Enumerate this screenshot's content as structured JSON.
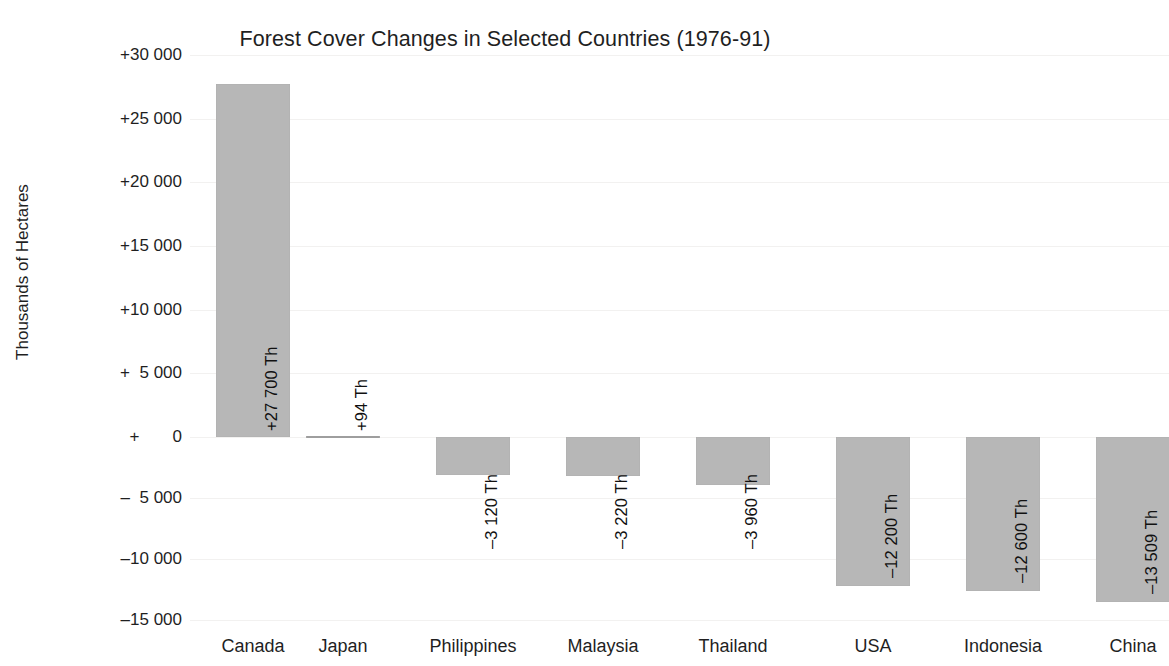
{
  "chart_data": {
    "type": "bar",
    "title": "Forest Cover Changes in Selected Countries (1976-91)",
    "xlabel": "",
    "ylabel": "Thousands of Hectares",
    "ylim": [
      -15000,
      30000
    ],
    "grid": true,
    "legend": null,
    "units": "Thousands of Hectares (Th)",
    "y_tick_labels": [
      "+30 000",
      "+25 000",
      "+20 000",
      "+15 000",
      "+10 000",
      "+  5 000",
      "+       0",
      "–  5 000",
      "–10 000",
      "–15 000"
    ],
    "y_tick_values": [
      30000,
      25000,
      20000,
      15000,
      10000,
      5000,
      0,
      -5000,
      -10000,
      -15000
    ],
    "categories": [
      "Canada",
      "Japan",
      "Philippines",
      "Malaysia",
      "Thailand",
      "USA",
      "Indonesia",
      "China"
    ],
    "values": [
      27700,
      94,
      -3120,
      -3220,
      -3960,
      -12200,
      -12600,
      -13509
    ],
    "data_labels": [
      "+27 700 Th",
      "+94 Th",
      "–3 120 Th",
      "–3 220 Th",
      "–3 960 Th",
      "–12 200 Th",
      "–12 600 Th",
      "–13 509 Th"
    ],
    "bar_color": "#b7b7b7",
    "background_color": "#ffffff",
    "text_color": "#1f1f1f"
  },
  "x_axis": {
    "labels": [
      "Canada",
      "Japan",
      "Philippines",
      "Malaysia",
      "Thailand",
      "USA",
      "Indonesia",
      "China"
    ],
    "last_label_truncated": "Chin"
  }
}
